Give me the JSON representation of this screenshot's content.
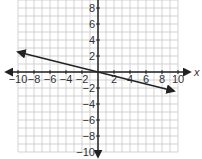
{
  "chart_data": {
    "type": "line",
    "title": "",
    "xlabel": "x",
    "ylabel": "",
    "xlim": [
      -10,
      10
    ],
    "ylim": [
      -10,
      9
    ],
    "grid": true,
    "x_ticks": [
      -10,
      -8,
      -6,
      -4,
      -2,
      2,
      4,
      6,
      8,
      10
    ],
    "y_ticks": [
      8,
      6,
      4,
      2,
      -2,
      -4,
      -6,
      -8,
      -10
    ],
    "series": [
      {
        "name": "line",
        "equation": "y = -1/4 x",
        "slope": -0.25,
        "intercept": 0,
        "x": [
          -10,
          9.5
        ],
        "y": [
          2.5,
          -2.375
        ],
        "arrows": "both"
      }
    ]
  },
  "labels": {
    "x_axis": "x",
    "x_ticks": [
      "−10",
      "−8",
      "−6",
      "−4",
      "−2",
      "2",
      "4",
      "6",
      "8",
      "10"
    ],
    "y_ticks": [
      "8",
      "6",
      "4",
      "2",
      "−2",
      "−4",
      "−6",
      "−8",
      "−10"
    ]
  },
  "colors": {
    "grid": "#c8c8c8",
    "axis": "#222222",
    "line": "#222222",
    "text": "#333333"
  }
}
